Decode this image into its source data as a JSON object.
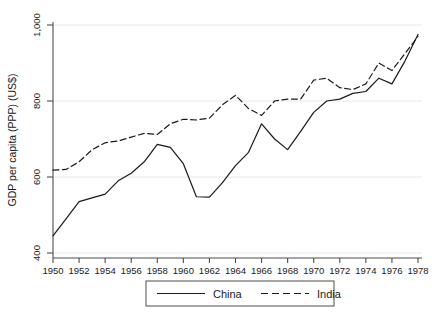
{
  "chart_data": {
    "type": "line",
    "title": "",
    "xlabel": "",
    "ylabel": "GDP per capita (PPP) (US$)",
    "xlim": [
      1950,
      1978
    ],
    "ylim": [
      400,
      1000
    ],
    "grid": true,
    "grid_axis": "y",
    "legend_position": "bottom-center",
    "x": [
      1950,
      1951,
      1952,
      1953,
      1954,
      1955,
      1956,
      1957,
      1958,
      1959,
      1960,
      1961,
      1962,
      1963,
      1964,
      1965,
      1966,
      1967,
      1968,
      1969,
      1970,
      1971,
      1972,
      1973,
      1974,
      1975,
      1976,
      1977,
      1978
    ],
    "xticks": [
      1950,
      1952,
      1954,
      1956,
      1958,
      1960,
      1962,
      1964,
      1966,
      1968,
      1970,
      1972,
      1974,
      1976,
      1978
    ],
    "xticklabels": [
      "1950",
      "1952",
      "1954",
      "1956",
      "1958",
      "1960",
      "1962",
      "1964",
      "1966",
      "1968",
      "1970",
      "1972",
      "1974",
      "1976",
      "1978"
    ],
    "yticks": [
      400,
      600,
      800,
      1000
    ],
    "yticklabels": [
      "400",
      "600",
      "800",
      "1,000"
    ],
    "series": [
      {
        "name": "China",
        "style": "solid",
        "color": "#1a1a1a",
        "values": [
          445,
          490,
          535,
          545,
          555,
          590,
          610,
          640,
          686,
          678,
          635,
          548,
          547,
          585,
          630,
          665,
          740,
          700,
          672,
          720,
          770,
          800,
          805,
          820,
          825,
          860,
          845,
          905,
          975
        ]
      },
      {
        "name": "India",
        "style": "dashed",
        "color": "#1a1a1a",
        "values": [
          618,
          620,
          640,
          672,
          690,
          695,
          705,
          715,
          712,
          740,
          752,
          750,
          755,
          790,
          815,
          780,
          762,
          800,
          805,
          805,
          855,
          860,
          835,
          830,
          845,
          900,
          880,
          925,
          970
        ]
      }
    ]
  },
  "legend": {
    "entries": [
      {
        "label": "China",
        "style": "solid"
      },
      {
        "label": "India",
        "style": "dashed"
      }
    ]
  }
}
